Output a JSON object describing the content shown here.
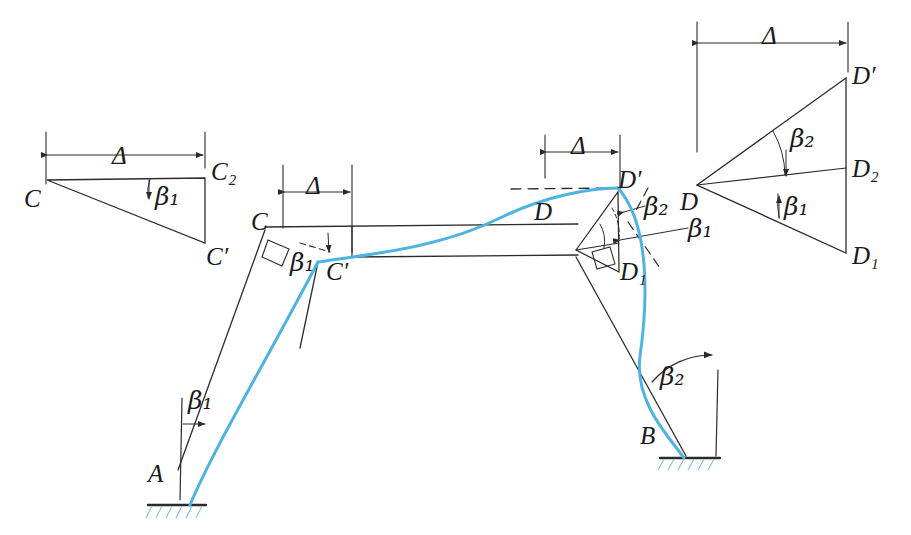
{
  "figure": {
    "type": "structural-frame-sidesway-diagram",
    "colors": {
      "line": "#2b2b2b",
      "deflected_curve": "#4fb3e0",
      "hatch": "#7fc4e8",
      "background": "#ffffff"
    }
  },
  "labels": {
    "support_a": "A",
    "support_b": "B",
    "joint_c": "C",
    "joint_c_prime": "C′",
    "joint_c_two": "C₂",
    "joint_d": "D",
    "joint_d_prime": "D′",
    "joint_d_one": "D₁",
    "joint_d_two": "D₂",
    "delta": "Δ",
    "beta_one": "β₁",
    "beta_two": "β₂"
  },
  "left_triangle": {
    "name": "displacement-triangle-c",
    "dimension": "Δ",
    "vertices": [
      "C",
      "C₂",
      "C′"
    ],
    "angle": "β₁"
  },
  "right_triangle": {
    "name": "displacement-triangle-d",
    "dimension": "Δ",
    "vertices": [
      "D",
      "D′",
      "D₂",
      "D₁"
    ],
    "angles": [
      "β₂",
      "β₁"
    ]
  },
  "frame": {
    "left_column": {
      "from": "A",
      "to": "C",
      "angle": "β₁"
    },
    "beam": {
      "from": "C",
      "to": "D",
      "dimensions": [
        "Δ",
        "Δ"
      ]
    },
    "right_column": {
      "from": "D",
      "to": "B",
      "angle": "β₂"
    },
    "joint_detail_c": {
      "angle": "β₁",
      "right_angle_marker": true
    },
    "joint_detail_d": {
      "angles": [
        "β₂",
        "β₁"
      ],
      "right_angle_marker": true
    }
  }
}
